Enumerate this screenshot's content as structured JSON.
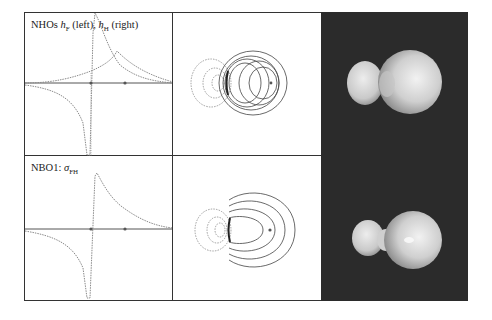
{
  "figure": {
    "panels": [
      {
        "row": "top",
        "label_prefix": "NHOs ",
        "label_h1": "h",
        "label_h1_sub": "F",
        "label_mid": " (left), ",
        "label_h2": "h",
        "label_h2_sub": "H",
        "label_suffix": " (right)",
        "description": "1D profile of natural hybrid orbitals along F–H axis",
        "nuclei_markers": 2
      },
      {
        "row": "bottom",
        "label_prefix": "NBO1: ",
        "label_sigma": "σ",
        "label_sigma_sub": "FH",
        "description": "1D profile of sigma FH natural bond orbital",
        "nuclei_markers": 2
      }
    ],
    "middle_column": {
      "top": "2D contour plot of overlapping NHOs (solid = positive, dashed = negative)",
      "bottom": "2D contour plot of σFH NBO"
    },
    "right_column": {
      "top": "3D isosurface of overlapping NHOs",
      "bottom": "3D isosurface of σFH NBO",
      "background_color": "#2b2b2b",
      "surface_color": "#d9d9d9"
    },
    "colors": {
      "frame": "#333333",
      "curve": "#8a8a8a",
      "axis": "#555555",
      "contour_solid": "#444444",
      "contour_dashed": "#888888"
    }
  }
}
